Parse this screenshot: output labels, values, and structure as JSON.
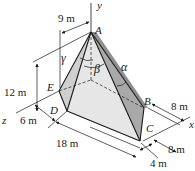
{
  "figure": {
    "points": {
      "A": "A",
      "B": "B",
      "C": "C",
      "D": "D",
      "E": "E"
    },
    "axes": {
      "x": "x",
      "y": "y",
      "z": "z"
    },
    "angles": {
      "alpha": "α",
      "beta": "β",
      "gamma": "γ"
    },
    "dimensions": {
      "top_offset": "9 m",
      "height": "12 m",
      "z_offset": "6 m",
      "length": "18 m",
      "right_upper": "8 m",
      "right_lower": "8 m",
      "bottom": "4 m"
    },
    "colors": {
      "line": "#1a1a1a",
      "face_light": "#e6e6e6",
      "face_mid": "#cfcfcf",
      "face_dark": "#a9a9a9"
    }
  }
}
